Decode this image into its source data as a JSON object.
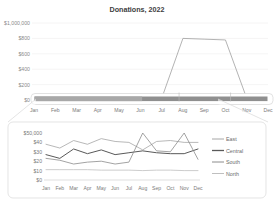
{
  "chart_data": [
    {
      "id": "overview",
      "type": "line",
      "title": "Donations, 2022",
      "xlabel": "",
      "ylabel": "",
      "categories": [
        "Jan",
        "Feb",
        "Mar",
        "Apr",
        "May",
        "Jun",
        "Jul",
        "Aug",
        "Sep",
        "Oct",
        "Nov",
        "Dec"
      ],
      "ytick_labels": [
        "$1,000,000",
        "$800",
        "$600",
        "$400",
        "$200",
        "$0"
      ],
      "ytick_values": [
        1000000,
        800000,
        600000,
        400000,
        200000,
        0
      ],
      "ylim": [
        0,
        1000000
      ],
      "grid": true,
      "legend": "none",
      "series": [
        {
          "name": "East",
          "values": [
            38000,
            34000,
            42000,
            38000,
            44000,
            41000,
            40000,
            32000,
            41000,
            42000,
            40000,
            40000
          ]
        },
        {
          "name": "Central",
          "values": [
            27000,
            23000,
            33000,
            28000,
            32000,
            27000,
            29000,
            31000,
            29000,
            28000,
            28000,
            33000
          ]
        },
        {
          "name": "South",
          "values": [
            23000,
            21000,
            17000,
            19000,
            20000,
            17000,
            19000,
            800000,
            790000,
            780000,
            22000,
            22000
          ]
        },
        {
          "name": "North",
          "values": [
            11000,
            11000,
            11000,
            11000,
            10500,
            10500,
            10500,
            10000,
            10500,
            10500,
            10000,
            10000
          ]
        }
      ],
      "annotation": "Spike to about $800,000 between Aug and Nov compresses all other series near zero."
    },
    {
      "id": "detail",
      "type": "line",
      "title": "",
      "xlabel": "",
      "ylabel": "",
      "categories": [
        "Jan",
        "Feb",
        "Mar",
        "Apr",
        "May",
        "Jun",
        "Jul",
        "Aug",
        "Sep",
        "Oct",
        "Nov",
        "Dec"
      ],
      "ytick_labels": [
        "$50,000",
        "$40",
        "$30",
        "$20",
        "$10",
        "$0"
      ],
      "ytick_values": [
        50000,
        40000,
        30000,
        20000,
        10000,
        0
      ],
      "ylim": [
        0,
        50000
      ],
      "grid": false,
      "legend": "right",
      "series": [
        {
          "name": "East",
          "color": "#a6a6a6",
          "values": [
            38000,
            34000,
            42000,
            38000,
            44000,
            41000,
            40000,
            32000,
            41000,
            42000,
            40000,
            40000
          ]
        },
        {
          "name": "Central",
          "color": "#595959",
          "values": [
            27000,
            23000,
            33000,
            28000,
            32000,
            27000,
            29000,
            31000,
            29000,
            28000,
            28000,
            33000
          ]
        },
        {
          "name": "South",
          "color": "#8c8c8c",
          "values": [
            23000,
            21000,
            17000,
            19000,
            20000,
            17000,
            19000,
            50000,
            31000,
            30000,
            50000,
            22000
          ]
        },
        {
          "name": "North",
          "color": "#bfbfbf",
          "values": [
            11000,
            11000,
            11000,
            11000,
            10500,
            10500,
            10500,
            10000,
            10500,
            10500,
            10000,
            10000
          ]
        }
      ],
      "annotation": "Magnified view of the compressed band; South shows two vertical spikes at Aug and Nov."
    }
  ],
  "overview": {
    "title": "Donations, 2022",
    "y_labels": [
      "$1,000,000",
      "$800",
      "$600",
      "$400",
      "$200",
      "$0"
    ],
    "x_labels": [
      "Jan",
      "Feb",
      "Mar",
      "Apr",
      "May",
      "Jun",
      "Jul",
      "Aug",
      "Sep",
      "Oct",
      "Nov",
      "Dec"
    ]
  },
  "detail": {
    "y_labels": [
      "$50,000",
      "$40",
      "$30",
      "$20",
      "$10",
      "$0"
    ],
    "x_labels": [
      "Jan",
      "Feb",
      "Mar",
      "Apr",
      "May",
      "Jun",
      "Jul",
      "Aug",
      "Sep",
      "Oct",
      "Nov",
      "Dec"
    ],
    "legend": [
      {
        "label": "East",
        "color": "#a6a6a6"
      },
      {
        "label": "Central",
        "color": "#595959"
      },
      {
        "label": "South",
        "color": "#8c8c8c"
      },
      {
        "label": "North",
        "color": "#bfbfbf"
      }
    ]
  },
  "colors": {
    "east": "#a6a6a6",
    "central": "#595959",
    "south": "#8c8c8c",
    "north": "#bfbfbf",
    "grid": "#eceaea",
    "text": "#7a7a7a",
    "title": "#404040",
    "panel_border": "#d9d9d9"
  }
}
